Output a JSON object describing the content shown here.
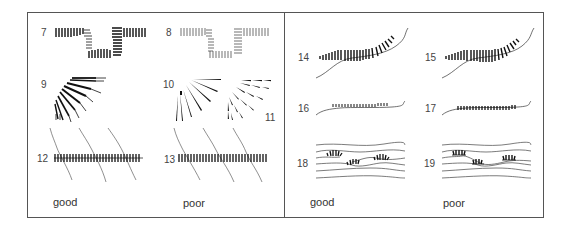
{
  "figure": {
    "left_panel": {
      "examples": [
        {
          "id": "7",
          "quality": "good",
          "shape": "right-angle corner hachures (thick)"
        },
        {
          "id": "8",
          "quality": "poor",
          "shape": "right-angle corner hachures (thin)"
        },
        {
          "id": "9",
          "quality": "good",
          "shape": "convex quarter-circle fan, graded lengths"
        },
        {
          "id": "10",
          "quality": "poor",
          "shape": "convex quarter-circle fan, long wedges"
        },
        {
          "id": "11",
          "quality": "poor",
          "shape": "convex fan with nested short wedges"
        },
        {
          "id": "12",
          "quality": "good",
          "shape": "straight hachure band across sloping lines"
        },
        {
          "id": "13",
          "quality": "poor",
          "shape": "straight hachure band across sloping lines"
        }
      ],
      "captions": {
        "good": "good",
        "poor": "poor"
      }
    },
    "right_panel": {
      "examples": [
        {
          "id": "14",
          "quality": "good",
          "shape": "curved hachures along curving contour"
        },
        {
          "id": "15",
          "quality": "poor",
          "shape": "curved hachures along curving contour"
        },
        {
          "id": "16",
          "quality": "good",
          "shape": "small ticks above gentle curve"
        },
        {
          "id": "17",
          "quality": "poor",
          "shape": "small ticks across gentle curve"
        },
        {
          "id": "18",
          "quality": "good",
          "shape": "fan groups within wavy bands"
        },
        {
          "id": "19",
          "quality": "poor",
          "shape": "fan groups within wavy bands"
        }
      ],
      "captions": {
        "good": "good",
        "poor": "poor"
      }
    },
    "colors": {
      "ink": "#111111",
      "line": "#555555",
      "background": "#ffffff"
    }
  }
}
